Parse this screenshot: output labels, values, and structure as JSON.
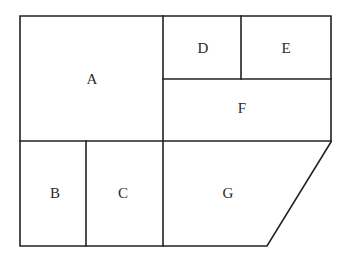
{
  "diagram": {
    "type": "floor-plan-partition",
    "line_color": "#222222",
    "background": "#ffffff",
    "regions": [
      {
        "id": "A",
        "label": "A",
        "cx": 92,
        "cy": 79
      },
      {
        "id": "B",
        "label": "B",
        "cx": 55,
        "cy": 193
      },
      {
        "id": "C",
        "label": "C",
        "cx": 123,
        "cy": 193
      },
      {
        "id": "D",
        "label": "D",
        "cx": 203,
        "cy": 48
      },
      {
        "id": "E",
        "label": "E",
        "cx": 286,
        "cy": 48
      },
      {
        "id": "F",
        "label": "F",
        "cx": 242,
        "cy": 108
      },
      {
        "id": "G",
        "label": "G",
        "cx": 228,
        "cy": 193
      }
    ]
  }
}
